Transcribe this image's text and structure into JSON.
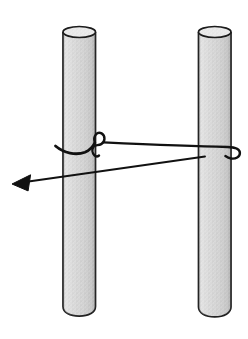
{
  "figure": {
    "type": "physics-illustration",
    "canvas": {
      "width": 248,
      "height": 339
    },
    "colors": {
      "background": "#ffffff",
      "poleFill": "#dcdcdc",
      "poleSpeckleDark": "#b2b2b2",
      "poleSpeckleMid": "#c6c6c6",
      "outline": "#1c1c1c",
      "rope": "#111111"
    },
    "elements": [
      {
        "name": "left-pole",
        "kind": "vertical cylinder with speckled gray fill"
      },
      {
        "name": "right-pole",
        "kind": "vertical cylinder with speckled gray fill"
      },
      {
        "name": "rope-knot",
        "kind": "overhand loop knot tied around left pole with hanging tail"
      },
      {
        "name": "rope-span",
        "kind": "rope running from knot to a hook around the right pole"
      },
      {
        "name": "pull-arrow",
        "kind": "force arrow angled slightly downward, pointing left"
      }
    ],
    "paths": {
      "left_pole_body": "M63,32 L63,306.5 C63,312.5 69.8,316.2 79.25,316.2 C88.7,316.2 95.5,312.5 95.5,306.5 L95.5,32",
      "left_pole_top": "M63,32 a16.25,5.5 0 1 0 32.5,0 a16.25,5.5 0 1 0 -32.5,0 z",
      "right_pole_body": "M198.5,32 L198.5,307 C198.5,313 205.3,316.8 214.75,316.8 C224.2,316.8 231,313 231,307 L231,32",
      "right_pole_top": "M198.5,32 a16.25,5.5 0 1 0 32.5,0 a16.25,5.5 0 1 0 -32.5,0 z",
      "rope_wrap": "M55.5,146 C64,153.2 76,155.6 85,152.2 C89.5,150.2 92.8,146.9 94.8,142.8",
      "rope_loop": "M94.8,142.8 C92.6,135.4 97.6,131.1 101.6,133.4 C105.7,135.8 105.2,141.9 101.2,144.1 C98.2,145.7 94.8,144.5 93.4,146.9 C91.9,149.4 92.1,153.1 94.4,155.3 C95.8,156.6 97.8,156.5 99,155.5",
      "rope_span_hook": "M103.5,142.4 C145,144.3 196,146.4 227.5,147 C234.6,147.2 239.9,149.2 239.9,153 C239.9,156.9 235.6,159.3 231,158.5 C228.9,158.1 226.9,157.1 225.4,156.1",
      "arrow_line": "M28.5,181.5 L205,156.5",
      "arrow_head": "M12,184 L30.6,174.8 L28.1,190.9 Z"
    }
  }
}
